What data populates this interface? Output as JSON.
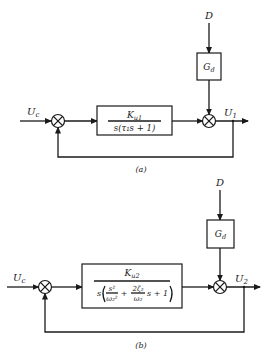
{
  "diagrams": [
    {
      "id": "a",
      "caption": "(a)",
      "input_label": "U",
      "input_sub": "c",
      "disturbance_label": "D",
      "disturbance_block": {
        "main": "G",
        "sub": "d"
      },
      "plant_block": {
        "numerator": {
          "main": "K",
          "sub": "u1"
        },
        "denominator": "s(τ₁s + 1)"
      },
      "output_label": "U",
      "output_sub": "1"
    },
    {
      "id": "b",
      "caption": "(b)",
      "input_label": "U",
      "input_sub": "c",
      "disturbance_label": "D",
      "disturbance_block": {
        "main": "G",
        "sub": "d"
      },
      "plant_block": {
        "numerator": {
          "main": "K",
          "sub": "u2"
        },
        "denominator": {
          "prefix": "s",
          "term1_num": "s²",
          "term1_den": "ω₂²",
          "plus1": "+",
          "term2_num": "2ζ₂",
          "term2_den": "ω₂",
          "term2_suffix": "s + 1"
        }
      },
      "output_label": "U",
      "output_sub": "2"
    }
  ]
}
